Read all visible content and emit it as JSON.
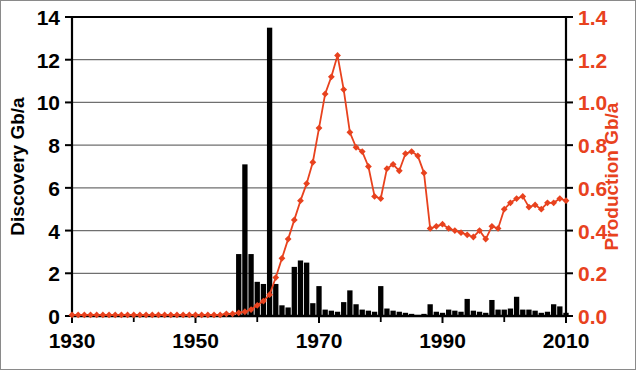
{
  "chart_data": {
    "type": "bar",
    "title": "",
    "xlabel": "",
    "ylabel": "Discovery Gb/a",
    "y2label": "Production Gb/a",
    "xlim": [
      1930,
      2010
    ],
    "ylim": [
      0,
      14
    ],
    "y2lim": [
      0.0,
      1.4
    ],
    "xticks": [
      1930,
      1950,
      1970,
      1990,
      2010
    ],
    "xticklabels": [
      "1930",
      "1950",
      "1970",
      "1990",
      "2010"
    ],
    "xminorticks": [
      1940,
      1960,
      1980,
      2000
    ],
    "yticks": [
      0,
      2,
      4,
      6,
      8,
      10,
      12,
      14
    ],
    "yticklabels": [
      "0",
      "2",
      "4",
      "6",
      "8",
      "10",
      "12",
      "14"
    ],
    "y2ticks": [
      0.0,
      0.2,
      0.4,
      0.6,
      0.8,
      1.0,
      1.2,
      1.4
    ],
    "y2ticklabels": [
      "0.0",
      "0.2",
      "0.4",
      "0.6",
      "0.8",
      "1.0",
      "1.2",
      "1.4"
    ],
    "grid": "horizontal",
    "legend": "none",
    "bar_color": "#000000",
    "line_color": "#E8421E",
    "axis_color": "#000000",
    "grid_color": "#6f6f6f",
    "series": [
      {
        "name": "Discovery Gb/a",
        "type": "bar",
        "axis": "left",
        "color": "#000000",
        "x": [
          1930,
          1931,
          1932,
          1933,
          1934,
          1935,
          1936,
          1937,
          1938,
          1939,
          1940,
          1941,
          1942,
          1943,
          1944,
          1945,
          1946,
          1947,
          1948,
          1949,
          1950,
          1951,
          1952,
          1953,
          1954,
          1955,
          1956,
          1957,
          1958,
          1959,
          1960,
          1961,
          1962,
          1963,
          1964,
          1965,
          1966,
          1967,
          1968,
          1969,
          1970,
          1971,
          1972,
          1973,
          1974,
          1975,
          1976,
          1977,
          1978,
          1979,
          1980,
          1981,
          1982,
          1983,
          1984,
          1985,
          1986,
          1987,
          1988,
          1989,
          1990,
          1991,
          1992,
          1993,
          1994,
          1995,
          1996,
          1997,
          1998,
          1999,
          2000,
          2001,
          2002,
          2003,
          2004,
          2005,
          2006,
          2007,
          2008,
          2009,
          2010
        ],
        "values": [
          0,
          0,
          0,
          0,
          0,
          0,
          0,
          0,
          0,
          0,
          0,
          0,
          0,
          0,
          0,
          0,
          0,
          0,
          0,
          0,
          0,
          0,
          0,
          0,
          0,
          0,
          0,
          2.9,
          7.1,
          2.9,
          1.6,
          1.5,
          13.5,
          1.5,
          0.5,
          0.4,
          2.3,
          2.6,
          2.5,
          0.6,
          1.4,
          0.3,
          0.25,
          0.2,
          0.65,
          1.2,
          0.55,
          0.3,
          0.25,
          0.2,
          1.4,
          0.35,
          0.25,
          0.2,
          0.15,
          0.1,
          0.05,
          0.1,
          0.55,
          0.2,
          0.15,
          0.3,
          0.25,
          0.2,
          0.8,
          0.25,
          0.2,
          0.15,
          0.75,
          0.3,
          0.3,
          0.35,
          0.9,
          0.3,
          0.3,
          0.25,
          0.15,
          0.2,
          0.55,
          0.45,
          0.15
        ]
      },
      {
        "name": "Production Gb/a",
        "type": "line",
        "axis": "right",
        "color": "#E8421E",
        "marker": "diamond",
        "x": [
          1930,
          1931,
          1932,
          1933,
          1934,
          1935,
          1936,
          1937,
          1938,
          1939,
          1940,
          1941,
          1942,
          1943,
          1944,
          1945,
          1946,
          1947,
          1948,
          1949,
          1950,
          1951,
          1952,
          1953,
          1954,
          1955,
          1956,
          1957,
          1958,
          1959,
          1960,
          1961,
          1962,
          1963,
          1964,
          1965,
          1966,
          1967,
          1968,
          1969,
          1970,
          1971,
          1972,
          1973,
          1974,
          1975,
          1976,
          1977,
          1978,
          1979,
          1980,
          1981,
          1982,
          1983,
          1984,
          1985,
          1986,
          1987,
          1988,
          1989,
          1990,
          1991,
          1992,
          1993,
          1994,
          1995,
          1996,
          1997,
          1998,
          1999,
          2000,
          2001,
          2002,
          2003,
          2004,
          2005,
          2006,
          2007,
          2008,
          2009,
          2010
        ],
        "values": [
          0.005,
          0.005,
          0.005,
          0.005,
          0.005,
          0.005,
          0.005,
          0.005,
          0.005,
          0.005,
          0.005,
          0.005,
          0.005,
          0.005,
          0.005,
          0.005,
          0.005,
          0.005,
          0.005,
          0.005,
          0.005,
          0.005,
          0.005,
          0.005,
          0.005,
          0.01,
          0.01,
          0.015,
          0.02,
          0.03,
          0.05,
          0.07,
          0.1,
          0.18,
          0.27,
          0.36,
          0.45,
          0.54,
          0.62,
          0.72,
          0.88,
          1.04,
          1.12,
          1.22,
          1.06,
          0.86,
          0.79,
          0.77,
          0.7,
          0.56,
          0.55,
          0.69,
          0.71,
          0.68,
          0.76,
          0.77,
          0.75,
          0.67,
          0.41,
          0.42,
          0.43,
          0.41,
          0.4,
          0.39,
          0.38,
          0.37,
          0.4,
          0.36,
          0.42,
          0.41,
          0.5,
          0.53,
          0.55,
          0.56,
          0.51,
          0.52,
          0.5,
          0.53,
          0.53,
          0.55,
          0.54
        ]
      }
    ]
  },
  "axes": {
    "left_label": "Discovery Gb/a",
    "right_label": "Production Gb/a"
  }
}
